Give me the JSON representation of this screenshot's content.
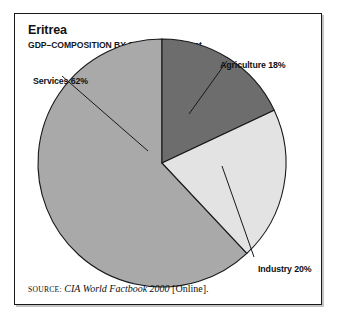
{
  "figure": {
    "title": "Eritrea",
    "subtitle": "GDP–COMPOSITION BY SECTOR–1995 est.",
    "source": {
      "label": "SOURCE:",
      "title": "CIA World Factbook 2000",
      "suffix": "[Online]."
    }
  },
  "labels": {
    "services": "Services 62%",
    "agriculture": "Agriculture 18%",
    "industry": "Industry 20%"
  },
  "chart_data": {
    "type": "pie",
    "title": "Eritrea",
    "subtitle": "GDP–COMPOSITION BY SECTOR–1995 est.",
    "categories": [
      "Agriculture",
      "Industry",
      "Services"
    ],
    "values": [
      18,
      20,
      62
    ],
    "unit": "percent",
    "data_labels": [
      "Agriculture 18%",
      "Industry 20%",
      "Services 62%"
    ],
    "start_angle_deg": 0,
    "direction": "clockwise",
    "colors": [
      "#6d6d6d",
      "#e3e3e3",
      "#a9a9a9"
    ],
    "slice_outline_color": "#15191c",
    "legend": "callout-labels-with-leader-lines",
    "grid": false,
    "xlabel": "",
    "ylabel": ""
  },
  "style": {
    "background": "#ffffff",
    "frame_border": "#15191c",
    "text_color": "#0e1113"
  }
}
